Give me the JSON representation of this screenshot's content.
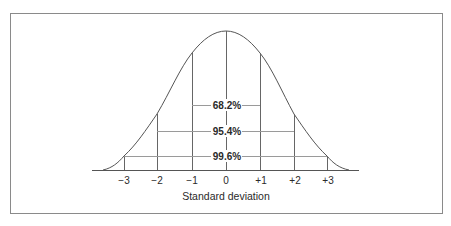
{
  "diagram": {
    "axis_label": "Standard deviation",
    "ticks": [
      "−3",
      "−2",
      "−1",
      "0",
      "+1",
      "+2",
      "+3"
    ],
    "intervals": [
      {
        "range": "±1",
        "label": "68.2%"
      },
      {
        "range": "±2",
        "label": "95.4%"
      },
      {
        "range": "±3",
        "label": "99.6%"
      }
    ],
    "colors": {
      "frame": "#8a8a8a",
      "curve": "#555555",
      "lines": "#666666",
      "interval_lines": "#9a9a9a",
      "text": "#2a2a2a"
    }
  }
}
